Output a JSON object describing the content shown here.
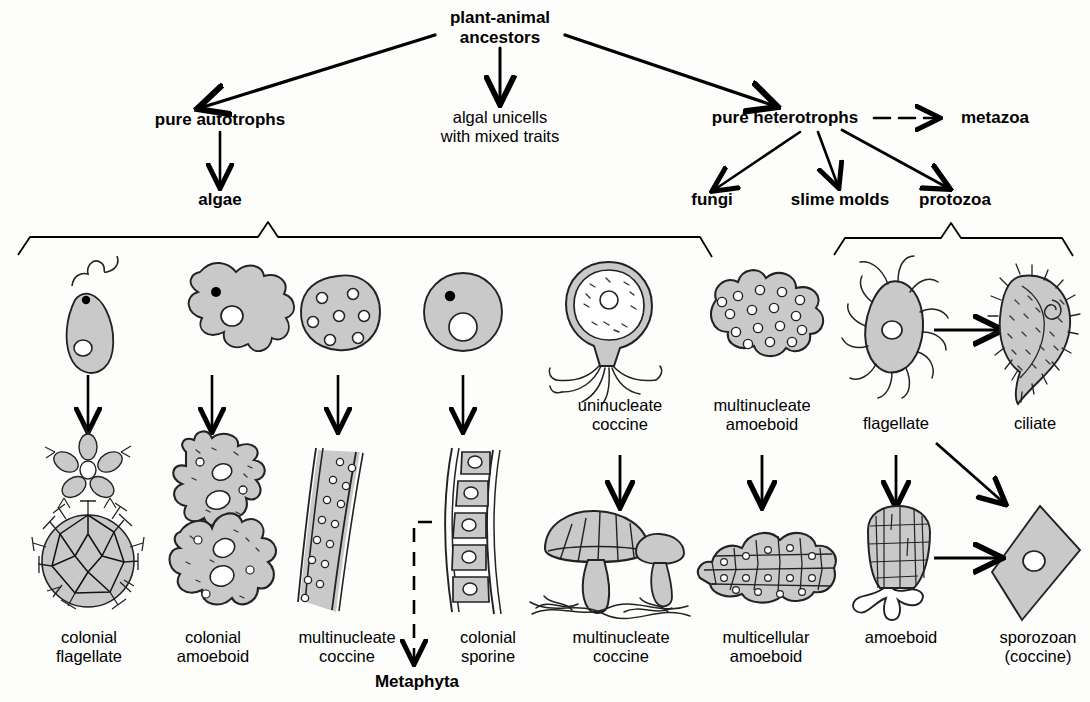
{
  "diagram": {
    "colors": {
      "cell_fill": "#c9c9c9",
      "cell_stroke": "#1a1a1a",
      "background": "#fdfdfb",
      "line": "#000000"
    }
  },
  "nodes": {
    "root": "plant-animal\nancestors",
    "root_line1": "plant-animal",
    "root_line2": "ancestors",
    "autotrophs": "pure autotrophs",
    "algal_unicells_line1": "algal unicells",
    "algal_unicells_line2": "with mixed traits",
    "heterotrophs": "pure heterotrophs",
    "metazoa": "metazoa",
    "algae": "algae",
    "fungi": "fungi",
    "slime_molds": "slime molds",
    "protozoa": "protozoa",
    "metaphyta": "Metaphyta"
  },
  "brackets": {
    "algae_bracket": "algae group bracket",
    "protozoa_bracket": "protozoa group bracket"
  },
  "organisms": {
    "algae_top": [
      {
        "name": "flagellate-unicell",
        "caption": ""
      },
      {
        "name": "amoeboid-unicell",
        "caption": ""
      },
      {
        "name": "coccine-multinucleate-unicell",
        "caption": ""
      },
      {
        "name": "sporine-unicell",
        "caption": ""
      }
    ],
    "algae_bottom_captions": [
      {
        "line1": "colonial",
        "line2": "flagellate"
      },
      {
        "line1": "colonial",
        "line2": "amoeboid"
      },
      {
        "line1": "multinucleate",
        "line2": "coccine"
      },
      {
        "line1": "colonial",
        "line2": "sporine"
      }
    ],
    "fungi_slime_mid_captions": [
      {
        "line1": "uninucleate",
        "line2": "coccine"
      },
      {
        "line1": "multinucleate",
        "line2": "amoeboid"
      }
    ],
    "fungi_slime_bottom_captions": [
      {
        "line1": "multinucleate",
        "line2": "coccine"
      },
      {
        "line1": "multicellular",
        "line2": "amoeboid"
      }
    ],
    "protozoa_mid_captions": [
      {
        "line1": "flagellate",
        "line2": ""
      },
      {
        "line1": "ciliate",
        "line2": ""
      }
    ],
    "protozoa_bottom_captions": [
      {
        "line1": "amoeboid",
        "line2": ""
      },
      {
        "line1": "sporozoan",
        "line2": "(coccine)"
      }
    ]
  }
}
